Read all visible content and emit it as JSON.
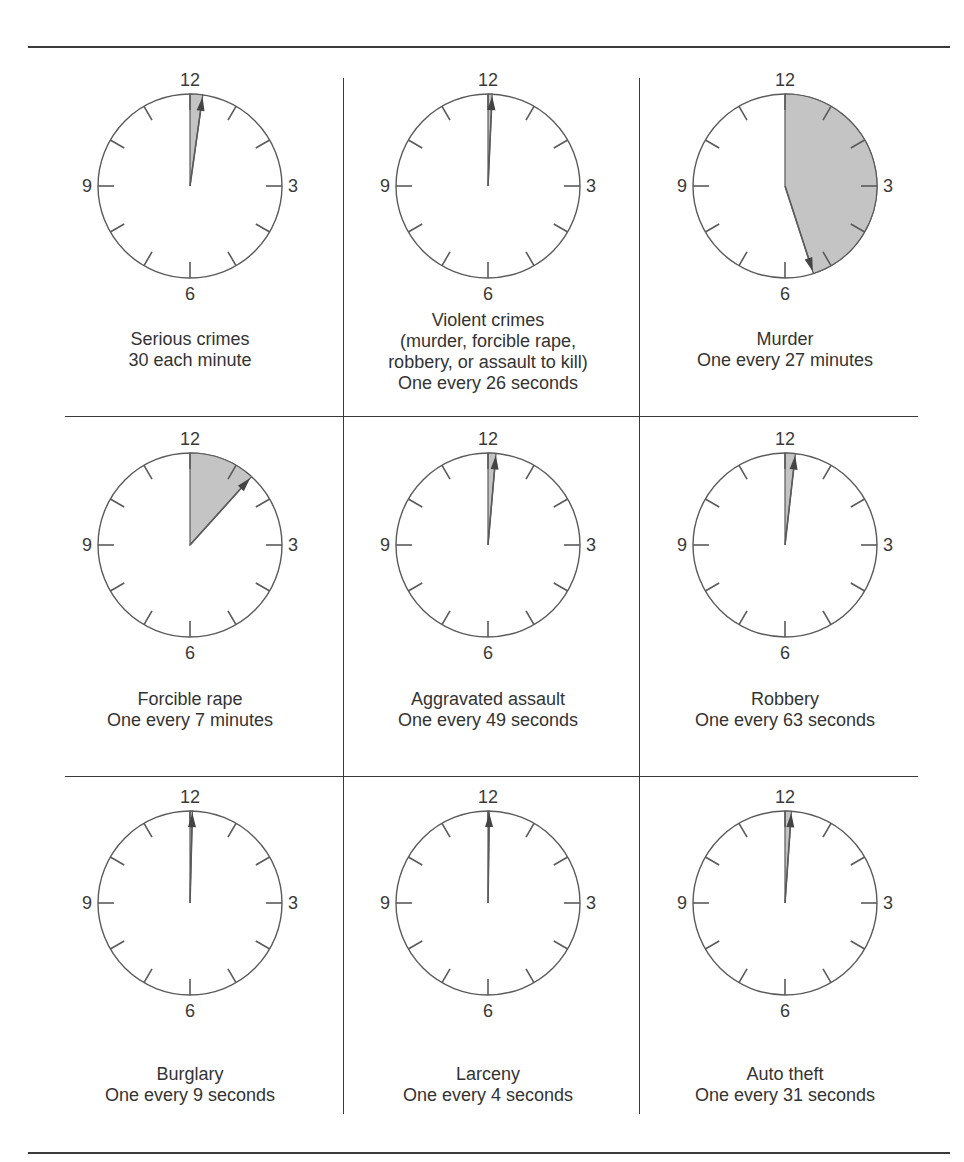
{
  "figure": {
    "colors": {
      "stroke": "#5a5a5a",
      "wedge_fill": "#c4c4c4",
      "rule": "#3a3a3a",
      "text": "#333333"
    },
    "clock_labels": {
      "top": "12",
      "right": "3",
      "bottom": "6",
      "left": "9"
    }
  },
  "chart_data": {
    "type": "diagram",
    "title": "",
    "clocks": [
      {
        "name": "Serious crimes",
        "lines": [
          "Serious crimes",
          "30 each minute"
        ],
        "interval": "30 each minute",
        "angle_deg": 8
      },
      {
        "name": "Violent crimes",
        "lines": [
          "Violent crimes",
          "(murder, forcible rape,",
          "robbery, or assault to kill)",
          "One every 26 seconds"
        ],
        "interval": "One every 26 seconds",
        "angle_deg": 2.6
      },
      {
        "name": "Murder",
        "lines": [
          "Murder",
          "One every 27 minutes"
        ],
        "interval": "One every 27 minutes",
        "angle_deg": 162
      },
      {
        "name": "Forcible rape",
        "lines": [
          "Forcible rape",
          "One every 7 minutes"
        ],
        "interval": "One every 7 minutes",
        "angle_deg": 42
      },
      {
        "name": "Aggravated assault",
        "lines": [
          "Aggravated assault",
          "One every 49 seconds"
        ],
        "interval": "One every 49 seconds",
        "angle_deg": 5
      },
      {
        "name": "Robbery",
        "lines": [
          "Robbery",
          "One every 63 seconds"
        ],
        "interval": "One every 63 seconds",
        "angle_deg": 6.5
      },
      {
        "name": "Burglary",
        "lines": [
          "Burglary",
          "One every 9 seconds"
        ],
        "interval": "One every 9 seconds",
        "angle_deg": 1.5
      },
      {
        "name": "Larceny",
        "lines": [
          "Larceny",
          "One every 4 seconds"
        ],
        "interval": "One every 4 seconds",
        "angle_deg": 0.8
      },
      {
        "name": "Auto theft",
        "lines": [
          "Auto theft",
          "One every 31 seconds"
        ],
        "interval": "One every 31 seconds",
        "angle_deg": 4
      }
    ]
  }
}
